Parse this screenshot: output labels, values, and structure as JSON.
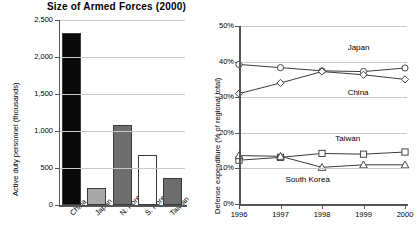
{
  "chart_data": [
    {
      "type": "bar",
      "title": "Size of Armed Forces (2000)",
      "xlabel": "",
      "ylabel": "Active duty personnel (thousands)",
      "categories": [
        "China",
        "Japan",
        "N. Korea",
        "S. Korea",
        "Taiwan"
      ],
      "values": [
        2320,
        230,
        1080,
        680,
        360
      ],
      "colors": [
        "#0a0a0a",
        "#a8a8a8",
        "#6e6e6e",
        "#ffffff",
        "#6e6e6e"
      ],
      "ylim": [
        0,
        2500
      ],
      "yticks": [
        0,
        500,
        1000,
        1500,
        2000,
        2500
      ],
      "ytick_labels": [
        "0",
        "500",
        "1,000",
        "1,500",
        "2,000",
        "2,500"
      ],
      "grid": true,
      "legend": "none"
    },
    {
      "type": "line",
      "title": "",
      "xlabel": "",
      "ylabel": "Defense expenditure (% of regional total)",
      "x": [
        1996,
        1997,
        1998,
        1999,
        2000
      ],
      "xtick_labels": [
        "1996",
        "1997",
        "1998",
        "1999",
        "2000"
      ],
      "ylim": [
        0,
        50
      ],
      "yticks": [
        0,
        10,
        20,
        30,
        40,
        50
      ],
      "ytick_labels": [
        "0%",
        "10%",
        "20%",
        "30%",
        "40%",
        "50%"
      ],
      "grid": true,
      "legend": "inline-annotations",
      "series": [
        {
          "name": "Japan",
          "marker": "circle",
          "values": [
            39.2,
            38.3,
            37.4,
            37.2,
            38.2
          ]
        },
        {
          "name": "China",
          "marker": "diamond",
          "values": [
            31.0,
            34.0,
            37.2,
            36.3,
            35.0
          ]
        },
        {
          "name": "Taiwan",
          "marker": "square",
          "values": [
            12.3,
            13.1,
            14.2,
            14.0,
            14.6
          ]
        },
        {
          "name": "South Korea",
          "marker": "triangle",
          "values": [
            13.6,
            13.4,
            10.3,
            11.0,
            11.0
          ]
        }
      ],
      "annotations": [
        {
          "text": "Japan",
          "x": 1999.1,
          "y": 43.5
        },
        {
          "text": "China",
          "x": 1999.1,
          "y": 31.0
        },
        {
          "text": "Taiwan",
          "x": 1998.8,
          "y": 18.0
        },
        {
          "text": "South Korea",
          "x": 1997.6,
          "y": 6.6
        }
      ]
    }
  ]
}
